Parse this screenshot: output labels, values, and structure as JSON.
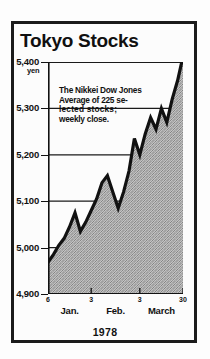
{
  "figure": {
    "title": "Tokyo Stocks",
    "year_label": "1978",
    "annotation": [
      "The Nikkei Dow Jones",
      "Average of 225 se-",
      "lected   stocks;",
      "weekly close."
    ],
    "unit_label": "yen",
    "border_color": "#1b1b1b",
    "line_color": "#111111",
    "fill_color": "#a8a8a8",
    "background_color": "#fcfcfc"
  },
  "chart_data": {
    "type": "area",
    "title": "Tokyo Stocks",
    "subtitle": "The Nikkei Dow Jones Average of 225 se-lected stocks; weekly close.",
    "xlabel": "1978",
    "ylabel": "yen",
    "ylim": [
      4900,
      5400
    ],
    "yticks": [
      4900,
      5000,
      5100,
      5200,
      5300,
      5400
    ],
    "ytick_labels": [
      "4,900",
      "5,000",
      "5,100",
      "5,200",
      "5,300",
      "5,400"
    ],
    "grid": true,
    "legend": "none",
    "xticks": [
      0,
      8,
      17,
      25
    ],
    "xtick_labels": [
      "6",
      "3",
      "3",
      "30"
    ],
    "xtick_months": [
      "Jan.",
      "Feb.",
      "March"
    ],
    "x": [
      0,
      1,
      2,
      3,
      4,
      5,
      6,
      7,
      8,
      9,
      10,
      11,
      12,
      13,
      14,
      15,
      16,
      17,
      18,
      19,
      20,
      21,
      22,
      23,
      24,
      25
    ],
    "values": [
      4968,
      4985,
      5005,
      5020,
      5045,
      5075,
      5035,
      5055,
      5080,
      5105,
      5140,
      5155,
      5120,
      5085,
      5120,
      5165,
      5235,
      5200,
      5245,
      5280,
      5255,
      5300,
      5270,
      5320,
      5360,
      5412
    ]
  }
}
